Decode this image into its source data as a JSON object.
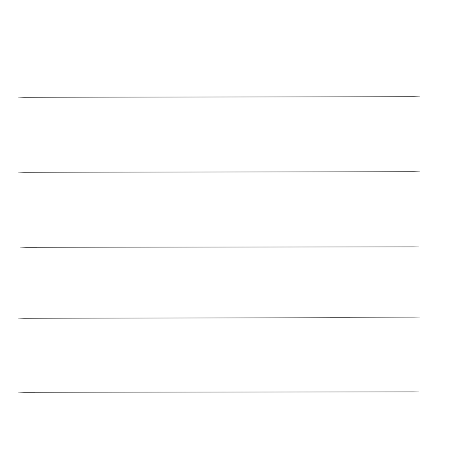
{
  "canvas": {
    "width": 450,
    "height": 459,
    "background_color": "#ffffff",
    "description": "blank white sheet with five horizontal ruled lines"
  },
  "chart_data": {
    "type": "line",
    "title": "",
    "subtitle": "",
    "xlabel": "",
    "ylabel": "",
    "grid": false,
    "legend_position": "none",
    "xlim": [
      0,
      450
    ],
    "ylim": [
      0,
      459
    ],
    "x_tick_labels": [],
    "y_tick_labels": [],
    "annotations": [],
    "series": [
      {
        "name": "rule-1",
        "values": [
          97,
          97
        ],
        "x": [
          18,
          420
        ]
      },
      {
        "name": "rule-2",
        "values": [
          172,
          172
        ],
        "x": [
          18,
          420
        ]
      },
      {
        "name": "rule-3",
        "values": [
          247,
          247
        ],
        "x": [
          20,
          419
        ]
      },
      {
        "name": "rule-4",
        "values": [
          318,
          318
        ],
        "x": [
          18,
          420
        ]
      },
      {
        "name": "rule-5",
        "values": [
          392,
          392
        ],
        "x": [
          18,
          419
        ]
      }
    ]
  },
  "rules": [
    {
      "label": "rule-1",
      "left": 18,
      "top": 97,
      "width": 402,
      "thickness": 1,
      "color": "#4a4a4a",
      "tilt_deg": -0.15
    },
    {
      "label": "rule-2",
      "left": 18,
      "top": 172,
      "width": 402,
      "thickness": 1,
      "color": "#4e4e4e",
      "tilt_deg": -0.15
    },
    {
      "label": "rule-3",
      "left": 20,
      "top": 247,
      "width": 399,
      "thickness": 1,
      "color": "#484848",
      "tilt_deg": -0.1
    },
    {
      "label": "rule-4",
      "left": 18,
      "top": 318,
      "width": 402,
      "thickness": 1,
      "color": "#515151",
      "tilt_deg": -0.18
    },
    {
      "label": "rule-5",
      "left": 18,
      "top": 392,
      "width": 401,
      "thickness": 1,
      "color": "#4d4d4d",
      "tilt_deg": -0.12
    }
  ]
}
